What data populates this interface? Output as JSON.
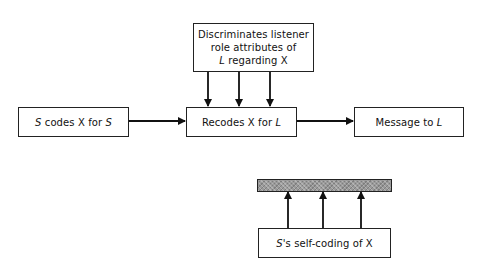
{
  "diagram": {
    "nodes": {
      "discriminates": {
        "line1": "Discriminates listener",
        "line2": "role attributes of",
        "line3_italic": "L",
        "line3_rest": " regarding X"
      },
      "s_codes": {
        "italic1": "S",
        "middle": " codes X for ",
        "italic2": "S"
      },
      "recodes": {
        "text": "Recodes X for ",
        "italic": "L"
      },
      "message": {
        "text": "Message to ",
        "italic": "L"
      },
      "self_coding": {
        "italic": "S",
        "text": "'s self-coding of X"
      },
      "hatched_bar": {
        "fill": "#9a9a9a"
      }
    },
    "edges": [
      {
        "from": "discriminates",
        "to": "recodes",
        "count": 3,
        "direction": "down"
      },
      {
        "from": "s_codes",
        "to": "recodes",
        "direction": "right"
      },
      {
        "from": "recodes",
        "to": "message",
        "direction": "right"
      },
      {
        "from": "self_coding",
        "to": "hatched_bar",
        "count": 3,
        "direction": "up"
      }
    ]
  }
}
